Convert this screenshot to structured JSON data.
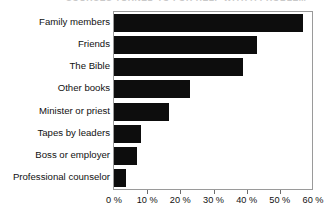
{
  "chart_data": {
    "type": "bar",
    "orientation": "horizontal",
    "title": "SOURCES TURNED TO FOR HELP WITH A PROBLEM",
    "xlabel": "",
    "ylabel": "",
    "xlim": [
      0,
      60
    ],
    "grid": false,
    "legend": null,
    "bar_color": "#0d0d0d",
    "categories": [
      "Family members",
      "Friends",
      "The Bible",
      "Other books",
      "Minister or priest",
      "Tapes by leaders",
      "Boss or employer",
      "Professional counselor"
    ],
    "values": [
      57,
      43,
      39,
      23,
      16.5,
      8,
      7,
      3.5
    ],
    "xticks": [
      0,
      10,
      20,
      30,
      40,
      50,
      60
    ],
    "xticklabels": [
      "0 %",
      "10 %",
      "20 %",
      "30 %",
      "40 %",
      "50 %",
      "60 %"
    ]
  }
}
